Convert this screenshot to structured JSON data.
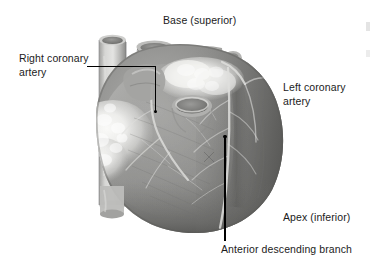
{
  "figure": {
    "background_color": "#ffffff",
    "text_color": "#1b1b1b",
    "leader_color": "#000000",
    "width": 372,
    "height": 259
  },
  "labels": {
    "base_superior": "Base (superior)",
    "right_coronary_artery": "Right coronary\nartery",
    "left_coronary_artery": "Left coronary\nartery",
    "apex_inferior": "Apex (inferior)",
    "anterior_descending_branch": "Anterior descending branch"
  },
  "illustration": {
    "subject": "heart-anterior-view",
    "rendering": "grayscale-photographic",
    "tones": {
      "fat_highlight": "#f2f2f0",
      "fat_light": "#dcdcda",
      "myocardium_light": "#a8a8a6",
      "myocardium_mid": "#8e8e8c",
      "myocardium_dark": "#6d6d6b",
      "shadow_deep": "#4e4e4c",
      "vessel_tube": "#c2c2c0",
      "vessel_lumen": "#787876",
      "coronary_vessel": "#d8d8d6"
    },
    "structures": [
      "superior-vena-cava",
      "aorta",
      "pulmonary-trunk",
      "right-atrium-fat-pad",
      "right-auricle",
      "pulmonary-vein-opening",
      "right-ventricle",
      "left-ventricle",
      "anterior-interventricular-sulcus",
      "apex",
      "inferior-vena-cava"
    ]
  }
}
